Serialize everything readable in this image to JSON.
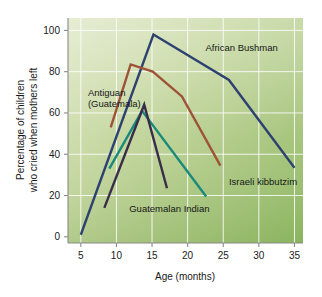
{
  "chart_data": {
    "type": "line",
    "title": "",
    "xlabel": "Age (months)",
    "ylabel": "Percentage of children who cried when mothers left",
    "ylabel_line1": "Percentage of children",
    "ylabel_line2": "who cried when mothers left",
    "xlim": [
      3.2,
      36.2
    ],
    "ylim": [
      -3,
      106
    ],
    "xticks": [
      5,
      10,
      15,
      20,
      25,
      30,
      35
    ],
    "yticks": [
      0,
      20,
      40,
      60,
      80,
      100
    ],
    "xtick_labels": [
      "5",
      "10",
      "15",
      "20",
      "25",
      "30",
      "35"
    ],
    "ytick_labels": [
      "0",
      "20",
      "40",
      "60",
      "80",
      "100"
    ],
    "grid": true,
    "grid_color": "#ffffff",
    "legend_position": "inline-annotations",
    "plot_background_colors": {
      "light": "#d6e2bc",
      "mid": "#bcd194",
      "dark": "#8cb45f"
    },
    "series": [
      {
        "name": "African Bushman",
        "color": "#2e4270",
        "label_x": 22.5,
        "label_y": 90,
        "x": [
          5,
          15.2,
          25.8,
          35
        ],
        "y": [
          1,
          98,
          76,
          33.5
        ]
      },
      {
        "name": "Antiguan (Guatemala)",
        "color": "#9e5238",
        "label_x": 6.0,
        "label_y": 68,
        "label_line1": "Antiguan",
        "label_line2": "(Guatemala)",
        "x": [
          9.2,
          12.0,
          15.1,
          19.2,
          24.6
        ],
        "y": [
          53,
          83.5,
          80,
          68,
          34.5
        ]
      },
      {
        "name": "Israeli kibbutzim",
        "color": "#1a8a7a",
        "label_x": 25.8,
        "label_y": 25,
        "x": [
          9.0,
          13.6,
          22.6
        ],
        "y": [
          33,
          61,
          19.5
        ]
      },
      {
        "name": "Guatemalan Indian",
        "color": "#3a2d4a",
        "label_x": 11.8,
        "label_y": 12,
        "x": [
          8.3,
          13.9,
          17.1
        ],
        "y": [
          14,
          64,
          23.5
        ]
      }
    ]
  }
}
